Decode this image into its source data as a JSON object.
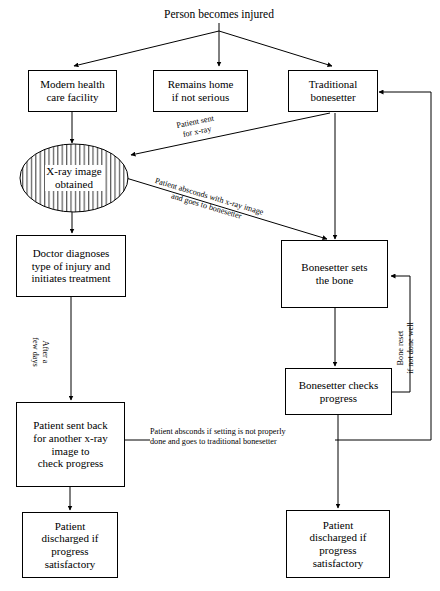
{
  "diagram": {
    "type": "flowchart",
    "title": "Person becomes injured",
    "orientation": "top-down",
    "nodes": [
      {
        "id": "start",
        "label": "Person becomes injured",
        "shape": "text"
      },
      {
        "id": "modern",
        "label": "Modern health\ncare facility",
        "shape": "rect"
      },
      {
        "id": "home",
        "label": "Remains home\nif not serious",
        "shape": "rect"
      },
      {
        "id": "traditional",
        "label": "Traditional\nbonesetter",
        "shape": "rect"
      },
      {
        "id": "xray",
        "label": "X-ray image\nobtained",
        "shape": "ellipse-hatched"
      },
      {
        "id": "doctor",
        "label": "Doctor diagnoses\ntype of injury and\ninitiates treatment",
        "shape": "rect"
      },
      {
        "id": "sets_bone",
        "label": "Bonesetter sets\nthe bone",
        "shape": "rect"
      },
      {
        "id": "checks",
        "label": "Bonesetter checks\nprogress",
        "shape": "rect"
      },
      {
        "id": "sent_back",
        "label": "Patient sent back\nfor another x-ray\nimage to\ncheck progress",
        "shape": "rect"
      },
      {
        "id": "discharged_left",
        "label": "Patient\ndischarged if\nprogress\nsatisfactory",
        "shape": "rect"
      },
      {
        "id": "discharged_right",
        "label": "Patient\ndischarged if\nprogress\nsatisfactory",
        "shape": "rect"
      }
    ],
    "edge_labels": {
      "patient_sent_xray_line1": "Patient sent",
      "patient_sent_xray_line2": "for x-ray",
      "absconds_xray_line1": "Patient absconds with x-ray image",
      "absconds_xray_line2": "and goes to bonesetter",
      "after_days_line1": "After a",
      "after_days_line2": "few days",
      "bone_reset_line1": "Bone reset",
      "bone_reset_line2": "if not done well",
      "absconds_setting_line1": "Patient absconds if setting is not properly",
      "absconds_setting_line2": "done and goes to traditional bonesetter"
    },
    "style": {
      "line_color": "#000000",
      "box_fill": "#ffffff",
      "text_color": "#000000",
      "background": "#ffffff"
    }
  }
}
